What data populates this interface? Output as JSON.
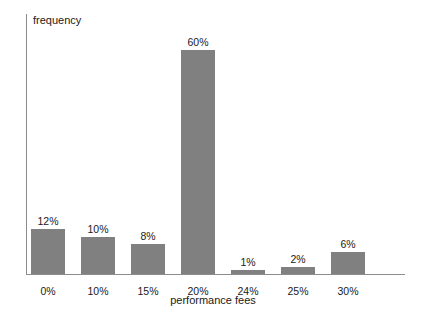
{
  "chart_data": {
    "type": "bar",
    "title": "",
    "xlabel": "performance fees",
    "ylabel": "frequency",
    "categories": [
      "0%",
      "10%",
      "15%",
      "20%",
      "24%",
      "25%",
      "30%"
    ],
    "values": [
      12,
      10,
      8,
      60,
      1,
      2,
      6
    ],
    "value_labels": [
      "12%",
      "10%",
      "8%",
      "60%",
      "1%",
      "2%",
      "6%"
    ],
    "ylim": [
      0,
      60
    ],
    "grid": false,
    "legend": "none",
    "bar_color": "#808080",
    "axis_color": "#8c8c8c",
    "text_color": "#1a1a1a",
    "background": "#ffffff"
  }
}
